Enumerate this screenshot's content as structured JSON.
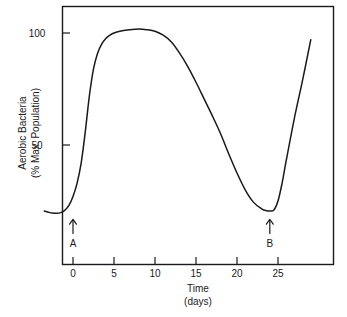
{
  "chart_data": {
    "type": "line",
    "title": "",
    "xlabel": "Time",
    "xlabel_units": "(days)",
    "ylabel_line1": "Aerobic Bacteria",
    "ylabel_line2": "(% Max. Population)",
    "xlim": [
      -3.5,
      29.5
    ],
    "ylim": [
      0,
      115
    ],
    "grid": false,
    "legend": null,
    "xticks": [
      0,
      5,
      10,
      15,
      20,
      25
    ],
    "xtick_labels": [
      "0",
      "5",
      "10",
      "15",
      "20",
      "25"
    ],
    "yticks": [
      50,
      100
    ],
    "ytick_labels": [
      "50",
      "100"
    ],
    "series": [
      {
        "name": "Aerobic Bacteria",
        "x": [
          -3.5,
          -3.0,
          -2.5,
          -2.0,
          -1.5,
          -1.0,
          -0.5,
          0.0,
          0.5,
          1.0,
          1.5,
          2.0,
          2.5,
          3.0,
          3.5,
          4.0,
          4.5,
          5.0,
          6.0,
          7.0,
          8.0,
          9.0,
          10.0,
          11.0,
          12.0,
          13.0,
          14.0,
          15.0,
          16.0,
          17.0,
          18.0,
          19.0,
          20.0,
          21.0,
          22.0,
          23.0,
          23.5,
          24.0,
          24.5,
          25.0,
          25.5,
          26.0,
          27.0,
          28.0,
          29.0
        ],
        "y": [
          20.5,
          20.0,
          19.6,
          19.5,
          19.8,
          20.8,
          23.0,
          27.0,
          33.0,
          42.0,
          56.0,
          72.0,
          84.0,
          91.0,
          95.0,
          97.5,
          99.0,
          100.0,
          101.0,
          101.5,
          101.8,
          101.5,
          100.8,
          99.0,
          96.0,
          91.0,
          85.0,
          78.0,
          70.5,
          63.0,
          55.0,
          46.0,
          37.5,
          30.0,
          24.5,
          21.5,
          20.8,
          20.5,
          21.0,
          25.0,
          33.0,
          43.0,
          62.0,
          79.0,
          97.0
        ]
      }
    ],
    "annotations": [
      {
        "label": "A",
        "x": 0,
        "arrow": "up",
        "y_text": 20
      },
      {
        "label": "B",
        "x": 24,
        "arrow": "up",
        "y_text": 20
      }
    ]
  },
  "figure": {
    "line_color": "#1a1a1a",
    "axis_color": "#1a1a1a",
    "background": "#ffffff"
  }
}
